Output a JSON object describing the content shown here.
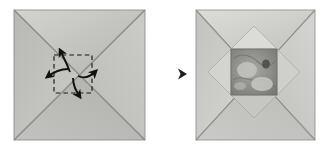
{
  "figure": {
    "type": "origami-fold-diagram",
    "background_color": "#ffffff",
    "step_count": 2,
    "title": "",
    "transition_arrow": {
      "name": "step-arrow",
      "direction": "right",
      "color": "#4a4a4a",
      "x_start": 152,
      "x_end": 186,
      "y": 74
    },
    "panels": [
      {
        "id": "panel-left",
        "label": "Step 1: flat square with center collapse markings",
        "square": {
          "x": 14,
          "y": 10,
          "width": 131,
          "height": 130
        },
        "paper_color_light": "#cfcfcc",
        "paper_color_mid": "#bdbdb9",
        "paper_color_dark": "#a9a9a5",
        "border_color": "#8f8f8b",
        "creases": [
          {
            "name": "diagonal-crease-tl-br",
            "from": "top-left",
            "to": "bottom-right",
            "color": "#8a8a86"
          },
          {
            "name": "diagonal-crease-tr-bl",
            "from": "top-right",
            "to": "bottom-left",
            "color": "#8a8a86"
          }
        ],
        "center_guide": {
          "name": "dashed-center-square",
          "x": 54,
          "y": 55,
          "size": 36,
          "stroke": "#1c1c1c",
          "dash": "4 3"
        },
        "arrows": [
          {
            "name": "fold-arrow-up",
            "direction": "up",
            "color": "#111111"
          },
          {
            "name": "fold-arrow-right",
            "direction": "right",
            "color": "#111111"
          },
          {
            "name": "fold-arrow-down",
            "direction": "down",
            "color": "#111111"
          },
          {
            "name": "fold-arrow-left",
            "direction": "left",
            "color": "#111111"
          }
        ]
      },
      {
        "id": "panel-right",
        "label": "Step 2: center opened with four triangular flaps",
        "square": {
          "x": 196,
          "y": 10,
          "width": 119,
          "height": 130
        },
        "paper_color_light": "#d6d6d3",
        "paper_color_mid": "#c4c4c0",
        "paper_color_dark": "#adadaa",
        "border_color": "#949490",
        "creases": [
          {
            "name": "diagonal-crease-tl-br",
            "from": "top-left",
            "to": "bottom-right",
            "color": "#8f8f8b"
          },
          {
            "name": "diagonal-crease-tr-bl",
            "from": "top-right",
            "to": "bottom-left",
            "color": "#8f8f8b"
          }
        ],
        "flaps": [
          {
            "name": "flap-top",
            "fill": "#d9d9d6"
          },
          {
            "name": "flap-right",
            "fill": "#cdcdc9"
          },
          {
            "name": "flap-bottom",
            "fill": "#c6c6c2"
          },
          {
            "name": "flap-left",
            "fill": "#d2d2cf"
          }
        ],
        "center_pocket": {
          "name": "center-crumpled-pocket",
          "x": 231,
          "y": 49,
          "size": 46,
          "fill_dark": "#7e7e7a",
          "fill_mid": "#9b9b97",
          "fill_light": "#c9c9c5"
        }
      }
    ]
  }
}
